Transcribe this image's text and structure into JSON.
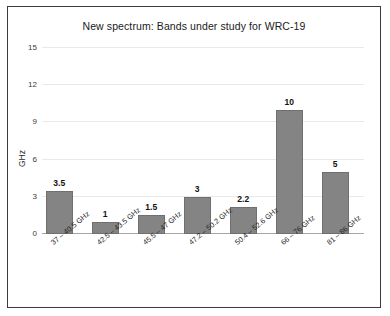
{
  "chart_data": {
    "type": "bar",
    "title": "New spectrum: Bands under study for WRC-19",
    "xlabel": "",
    "ylabel": "GHz",
    "ylim": [
      0,
      15
    ],
    "yticks": [
      "0",
      "3",
      "6",
      "9",
      "12",
      "15"
    ],
    "grid": true,
    "legend": "none",
    "bar_color": "#848484",
    "categories": [
      "37 – 40.5 GHz",
      "42.5 – 43.5 GHz",
      "45.5 – 47 GHz",
      "47.2 – 50.2 GHz",
      "50.4 – 52.6 GHz",
      "66 – 76 GHz",
      "81 – 86 GHz"
    ],
    "values": [
      3.5,
      1,
      1.5,
      3,
      2.2,
      10,
      5
    ],
    "value_labels": [
      "3.5",
      "1",
      "1.5",
      "3",
      "2.2",
      "10",
      "5"
    ]
  }
}
